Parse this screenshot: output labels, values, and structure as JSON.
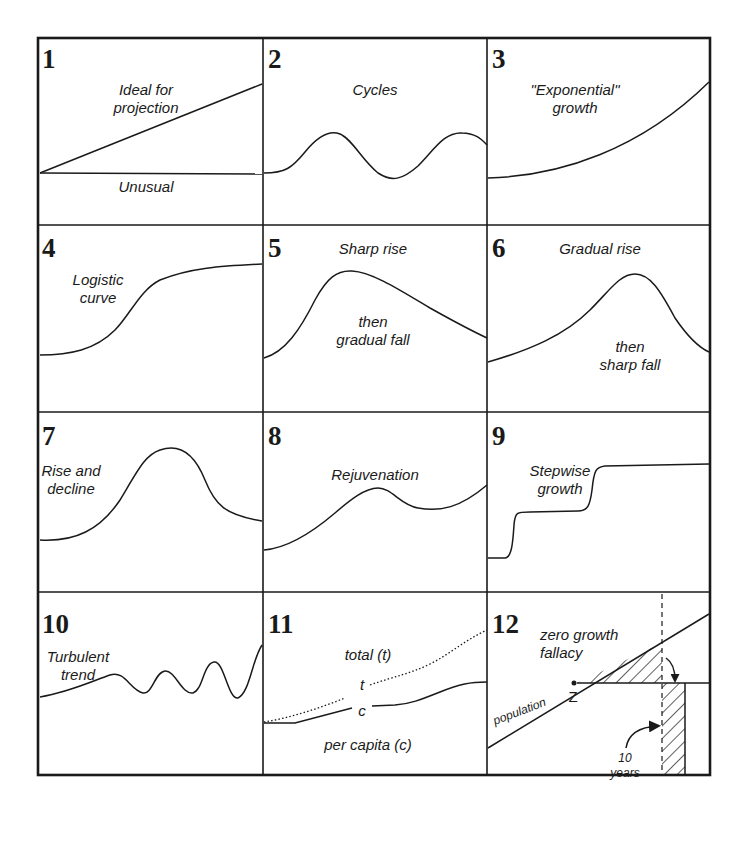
{
  "figure": {
    "layout": {
      "rows": 4,
      "columns": 3
    },
    "panels": [
      {
        "number": "1",
        "labels": [
          "Ideal for",
          "projection",
          "Unusual"
        ]
      },
      {
        "number": "2",
        "labels": [
          "Cycles"
        ]
      },
      {
        "number": "3",
        "labels": [
          "\"Exponential\"",
          "growth"
        ]
      },
      {
        "number": "4",
        "labels": [
          "Logistic",
          "curve"
        ]
      },
      {
        "number": "5",
        "labels": [
          "Sharp rise",
          "then",
          "gradual fall"
        ]
      },
      {
        "number": "6",
        "labels": [
          "Gradual rise",
          "then",
          "sharp fall"
        ]
      },
      {
        "number": "7",
        "labels": [
          "Rise and",
          "decline"
        ]
      },
      {
        "number": "8",
        "labels": [
          "Rejuvenation"
        ]
      },
      {
        "number": "9",
        "labels": [
          "Stepwise",
          "growth"
        ]
      },
      {
        "number": "10",
        "labels": [
          "Turbulent",
          "trend"
        ]
      },
      {
        "number": "11",
        "labels": [
          "total (t)",
          "t",
          "c",
          "per capita (c)"
        ]
      },
      {
        "number": "12",
        "labels": [
          "zero growth",
          "fallacy",
          "population",
          "Z",
          "10",
          "years"
        ]
      }
    ]
  }
}
